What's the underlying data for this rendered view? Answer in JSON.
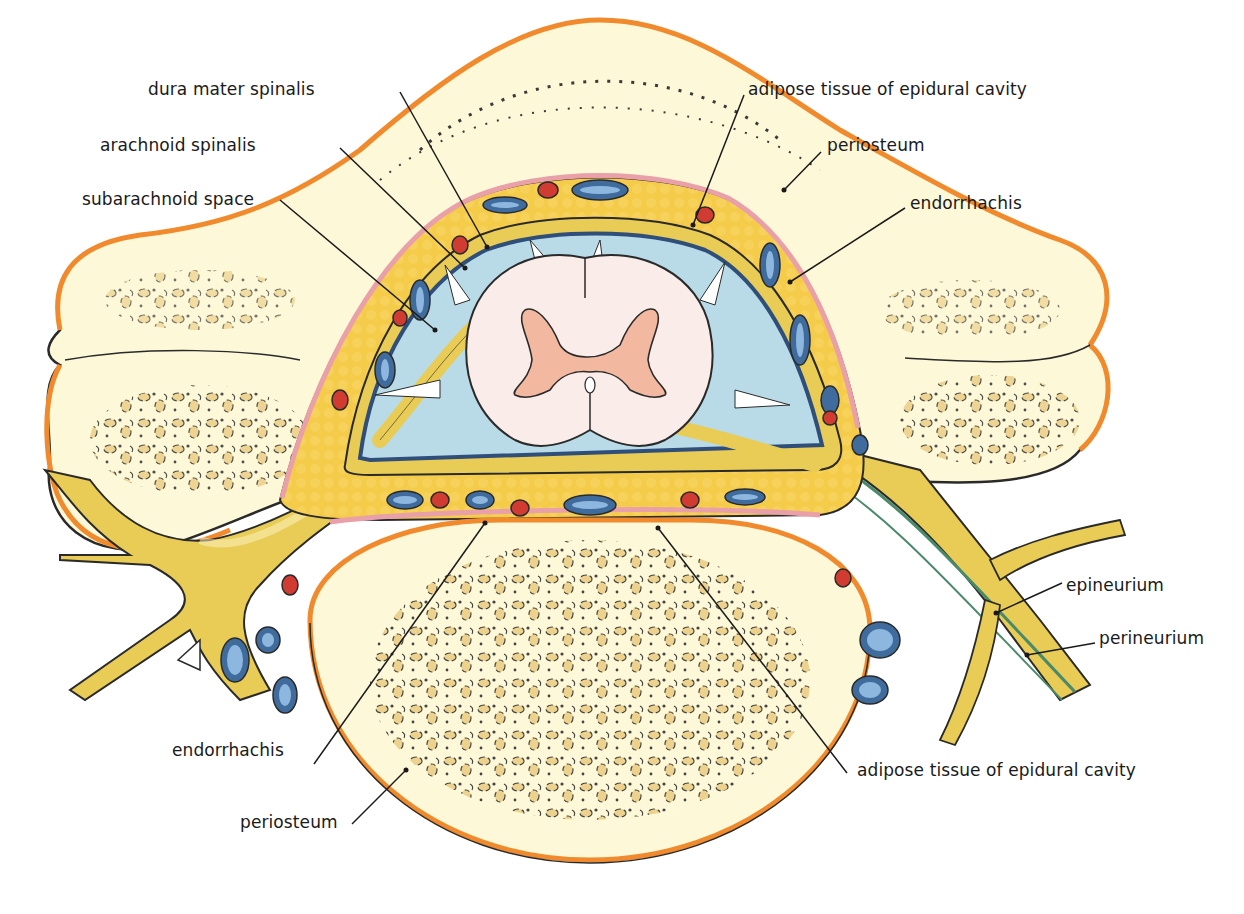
{
  "figure": {
    "caption": ""
  },
  "labels": {
    "dura_mater_spinalis": "dura mater spinalis",
    "arachnoid_spinalis": "arachnoid spinalis",
    "subarachnoid_space": "subarachnoid space",
    "adipose_top": "adipose tissue of epidural cavity",
    "periosteum_top": "periosteum",
    "endorrhachis_top": "endorrhachis",
    "epineurium": "epineurium",
    "perineurium": "perineurium",
    "adipose_bottom": "adipose tissue of epidural cavity",
    "endorrhachis_bottom": "endorrhachis",
    "periosteum_bottom": "periosteum"
  },
  "colors": {
    "bone": "#fcf8d8",
    "periosteum": "#f08a2c",
    "endorrhachis": "#e9a0a8",
    "adipose": "#f5cc4a",
    "subarachnoid": "#b9dbe8",
    "cord_white": "#f9ece9",
    "cord_grey": "#f3b9a0",
    "vein": "#3f6c9c",
    "vein_inner": "#8db7de",
    "artery": "#d13c32",
    "nerve": "#e8cc56",
    "nerve_sheath": "#4a8a6a",
    "outline": "#2a2a2a",
    "trabecula": "#e8c879"
  }
}
